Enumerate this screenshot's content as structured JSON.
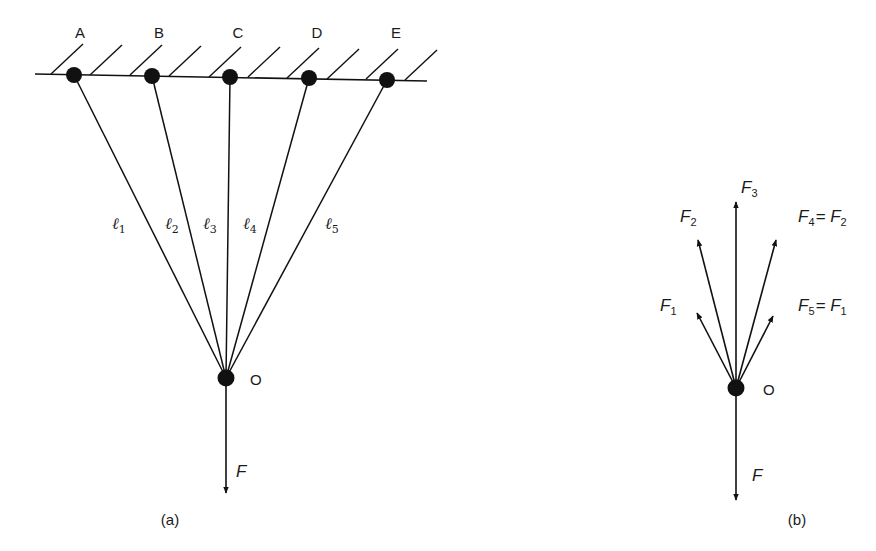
{
  "header_fragment": "",
  "diagram_a": {
    "caption": "(a)",
    "support_points": [
      {
        "label": "A",
        "x": 74,
        "y": 75
      },
      {
        "label": "B",
        "x": 152,
        "y": 76
      },
      {
        "label": "C",
        "x": 230,
        "y": 77
      },
      {
        "label": "D",
        "x": 309,
        "y": 78
      },
      {
        "label": "E",
        "x": 387,
        "y": 80
      }
    ],
    "lines": [
      {
        "symbol": "ℓ",
        "sub": "1",
        "lx": 112,
        "ly": 228
      },
      {
        "symbol": "ℓ",
        "sub": "2",
        "lx": 166,
        "ly": 228
      },
      {
        "symbol": "ℓ",
        "sub": "3",
        "lx": 203,
        "ly": 228
      },
      {
        "symbol": "ℓ",
        "sub": "4",
        "lx": 243,
        "ly": 228
      },
      {
        "symbol": "ℓ",
        "sub": "5",
        "lx": 325,
        "ly": 228
      }
    ],
    "joint": {
      "label": "O",
      "x": 226,
      "y": 378
    },
    "load": {
      "label": "F"
    }
  },
  "diagram_b": {
    "caption": "(b)",
    "joint": {
      "label": "O",
      "x": 736,
      "y": 388
    },
    "forces": [
      {
        "name": "F",
        "sub": "1",
        "text": "",
        "tip": [
          697,
          313
        ]
      },
      {
        "name": "F",
        "sub": "2",
        "text": "",
        "tip": [
          698,
          240
        ]
      },
      {
        "name": "F",
        "sub": "3",
        "text": "",
        "tip": [
          736,
          202
        ]
      },
      {
        "name": "F",
        "sub": "4",
        "text": "= F",
        "sub2": "2",
        "tip": [
          776,
          240
        ]
      },
      {
        "name": "F",
        "sub": "5",
        "text": "= F",
        "sub2": "1",
        "tip": [
          773,
          316
        ]
      }
    ],
    "load": {
      "label": "F"
    }
  },
  "colors": {
    "ink": "#111111",
    "background": "#ffffff"
  }
}
